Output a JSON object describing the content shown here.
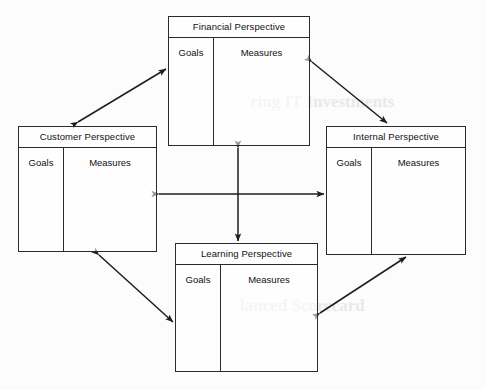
{
  "diagram": {
    "name": "Balanced Scorecard Perspectives",
    "colors": {
      "line": "#2b2b2b",
      "text": "#111111",
      "background": "#fcfcfc"
    },
    "column_headers": {
      "goals": "Goals",
      "measures": "Measures"
    },
    "boxes": [
      {
        "id": "financial",
        "title": "Financial Perspective",
        "goals": "Goals",
        "measures": "Measures"
      },
      {
        "id": "customer",
        "title": "Customer Perspective",
        "goals": "Goals",
        "measures": "Measures"
      },
      {
        "id": "internal",
        "title": "Internal Perspective",
        "goals": "Goals",
        "measures": "Measures"
      },
      {
        "id": "learning",
        "title": "Learning Perspective",
        "goals": "Goals",
        "measures": "Measures"
      }
    ],
    "connectors": [
      {
        "id": "customer-financial",
        "from": "customer",
        "to": "financial",
        "style": "double-arrow",
        "orientation": "diagonal"
      },
      {
        "id": "financial-internal",
        "from": "financial",
        "to": "internal",
        "style": "double-arrow",
        "orientation": "diagonal"
      },
      {
        "id": "customer-learning",
        "from": "customer",
        "to": "learning",
        "style": "double-arrow",
        "orientation": "diagonal"
      },
      {
        "id": "learning-internal",
        "from": "learning",
        "to": "internal",
        "style": "double-arrow",
        "orientation": "diagonal"
      },
      {
        "id": "customer-internal",
        "from": "customer",
        "to": "internal",
        "style": "double-arrow",
        "orientation": "horizontal"
      },
      {
        "id": "financial-learning",
        "from": "financial",
        "to": "learning",
        "style": "double-arrow",
        "orientation": "vertical"
      }
    ]
  },
  "background_text": {
    "line1": "ring IT Investments",
    "line2": "lanced Scorecard"
  }
}
